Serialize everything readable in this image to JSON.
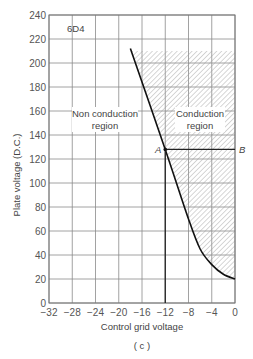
{
  "chart_data": {
    "type": "line",
    "title": "6D4",
    "caption": "(c)",
    "xlabel": "Control grid voltage",
    "ylabel": "Plate voltage (D.C.)",
    "xlim": [
      -32,
      0
    ],
    "ylim": [
      0,
      240
    ],
    "x_ticks": [
      -32,
      -28,
      -24,
      -20,
      -16,
      -12,
      -8,
      -4,
      0
    ],
    "x_tick_labels": [
      "−32",
      "−28",
      "−24",
      "−20",
      "−16",
      "−12",
      "−8",
      "−4",
      "0"
    ],
    "y_ticks": [
      0,
      20,
      40,
      60,
      80,
      100,
      120,
      140,
      160,
      180,
      200,
      220,
      240
    ],
    "y_tick_labels": [
      "0",
      "20",
      "40",
      "60",
      "80",
      "100",
      "120",
      "140",
      "160",
      "180",
      "200",
      "220",
      "240"
    ],
    "grid": true,
    "series": [
      {
        "name": "Critical grid voltage curve",
        "x": [
          -18,
          -12,
          -8,
          -6,
          -4,
          -2,
          0
        ],
        "y": [
          212,
          128,
          70,
          45,
          32,
          24,
          20
        ]
      },
      {
        "name": "Operating line A-B",
        "x": [
          -12,
          0
        ],
        "y": [
          128,
          128
        ]
      },
      {
        "name": "Bias line",
        "x": [
          -12,
          -12
        ],
        "y": [
          0,
          128
        ]
      }
    ],
    "shaded_region": {
      "name": "Conduction region",
      "bounded_by": "curve (left/bottom), x=0 (right), y=210 (top)",
      "pattern": "diagonal hatch"
    },
    "annotations": [
      {
        "text": "Non conduction region",
        "x": -24,
        "y": 145
      },
      {
        "text": "Conduction region",
        "x": -6,
        "y": 145
      },
      {
        "text": "A",
        "x": -12,
        "y": 128
      },
      {
        "text": "B",
        "x": 0,
        "y": 128
      }
    ]
  },
  "labels": {
    "tube": "6D4",
    "non_conduction_1": "Non conduction",
    "non_conduction_2": "region",
    "conduction_1": "Conduction",
    "conduction_2": "region",
    "point_a": "A",
    "point_b": "B",
    "xlabel": "Control grid voltage",
    "ylabel": "Plate voltage (D.C.)",
    "caption": "( c )"
  }
}
